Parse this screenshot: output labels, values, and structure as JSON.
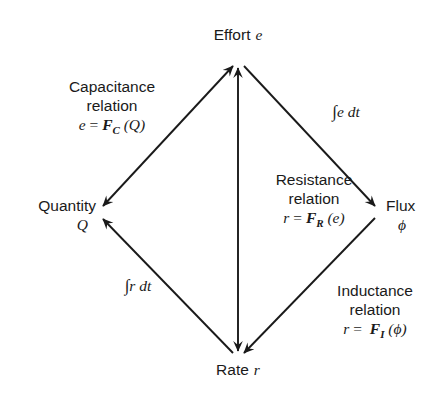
{
  "diagram": {
    "stroke_color": "#1a1a1a",
    "background_color": "#ffffff",
    "vertices": [
      {
        "id": "effort",
        "name": "Effort",
        "symbol": "e",
        "position": "top",
        "x": 238,
        "y": 60
      },
      {
        "id": "quantity",
        "name": "Quantity",
        "symbol": "Q",
        "position": "left",
        "x": 98,
        "y": 212
      },
      {
        "id": "flux",
        "name": "Flux",
        "symbol": "ϕ",
        "position": "right",
        "x": 380,
        "y": 212
      },
      {
        "id": "rate",
        "name": "Rate",
        "symbol": "r",
        "position": "bottom",
        "x": 238,
        "y": 358
      }
    ],
    "edges": [
      {
        "id": "capacitance",
        "from": "quantity",
        "to": "effort",
        "arrowheads": "both",
        "label_lines": [
          "Capacitance",
          "relation"
        ],
        "formula": {
          "lhs": "e",
          "equals": "=",
          "func": "F",
          "subscript": "C",
          "arg": "(Q)",
          "text": "e = F_C (Q)"
        }
      },
      {
        "id": "integral-e-dt",
        "from": "effort",
        "to": "flux",
        "arrowheads": "to",
        "label_lines": [],
        "formula": {
          "integral": "∫",
          "body": "e dt",
          "text": "∫e dt"
        }
      },
      {
        "id": "inductance",
        "from": "flux",
        "to": "rate",
        "arrowheads": "to",
        "label_lines": [
          "Inductance",
          "relation"
        ],
        "formula": {
          "lhs": "r",
          "equals": "=",
          "func": "F",
          "subscript": "I",
          "arg": "(ϕ)",
          "text": "r = F_I (ϕ)"
        }
      },
      {
        "id": "integral-r-dt",
        "from": "rate",
        "to": "quantity",
        "arrowheads": "to",
        "label_lines": [],
        "formula": {
          "integral": "∫",
          "body": "r dt",
          "text": "∫r dt"
        }
      },
      {
        "id": "resistance",
        "from": "rate",
        "to": "effort",
        "arrowheads": "both",
        "label_lines": [
          "Resistance",
          "relation"
        ],
        "formula": {
          "lhs": "r",
          "equals": "=",
          "func": "F",
          "subscript": "R",
          "arg": "(e)",
          "text": "r = F_R (e)"
        }
      }
    ]
  }
}
